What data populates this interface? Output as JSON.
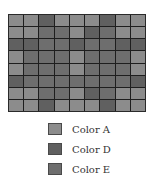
{
  "colors": {
    "A": "#8c8c8c",
    "D": "#606060",
    "E": "#6e6e6e"
  },
  "grid": {
    "rows": 8,
    "cols": 9,
    "cells": [
      [
        "A",
        "A",
        "D",
        "A",
        "A",
        "A",
        "D",
        "A",
        "A"
      ],
      [
        "A",
        "A",
        "E",
        "E",
        "A",
        "D",
        "E",
        "A",
        "A"
      ],
      [
        "D",
        "D",
        "E",
        "E",
        "D",
        "E",
        "E",
        "D",
        "D"
      ],
      [
        "A",
        "E",
        "E",
        "E",
        "A",
        "E",
        "E",
        "E",
        "A"
      ],
      [
        "A",
        "E",
        "E",
        "E",
        "A",
        "E",
        "E",
        "E",
        "A"
      ],
      [
        "D",
        "E",
        "E",
        "E",
        "E",
        "E",
        "E",
        "E",
        "D"
      ],
      [
        "A",
        "A",
        "E",
        "E",
        "A",
        "D",
        "E",
        "A",
        "A"
      ],
      [
        "A",
        "A",
        "D",
        "A",
        "A",
        "A",
        "D",
        "A",
        "A"
      ]
    ]
  },
  "legend": {
    "items": [
      {
        "key": "A",
        "label": "Color A"
      },
      {
        "key": "D",
        "label": "Color D"
      },
      {
        "key": "E",
        "label": "Color E"
      }
    ]
  }
}
